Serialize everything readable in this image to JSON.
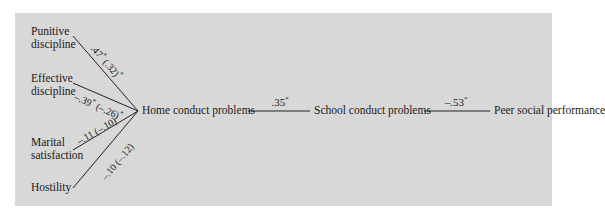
{
  "diagram": {
    "type": "path-model",
    "background_color": "#d8d8d8",
    "predictors": [
      {
        "id": "punitive",
        "label_line1": "Punitive",
        "label_line2": "discipline",
        "coef": ".47",
        "coef_sig": "*",
        "coef_adj": "(.32)",
        "coef_adj_sig": "*"
      },
      {
        "id": "effective",
        "label_line1": "Effective",
        "label_line2": "discipline",
        "coef": "–.39",
        "coef_sig": "*",
        "coef_adj": "(–.26)",
        "coef_adj_sig": "*"
      },
      {
        "id": "marital",
        "label_line1": "Marital",
        "label_line2": "satisfaction",
        "coef": "–.11",
        "coef_sig": "",
        "coef_adj": "(–.10)",
        "coef_adj_sig": ""
      },
      {
        "id": "hostility",
        "label_line1": "Hostility",
        "label_line2": "",
        "coef": "–.10",
        "coef_sig": "",
        "coef_adj": "(–.12)",
        "coef_adj_sig": ""
      }
    ],
    "chain": [
      {
        "label": "Home conduct problems"
      },
      {
        "label": "School conduct problems",
        "coef_from_prev": ".35",
        "sig": "*"
      },
      {
        "label": "Peer social performance",
        "coef_from_prev": "–.53",
        "sig": "*"
      }
    ]
  }
}
